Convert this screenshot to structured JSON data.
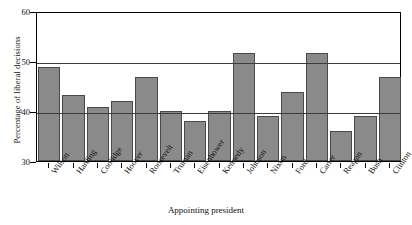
{
  "chart_data": {
    "type": "bar",
    "title": "",
    "xlabel": "Appointing president",
    "ylabel": "Percentage of liberal decisions",
    "ylim": [
      30,
      60
    ],
    "yticks": [
      30,
      40,
      50,
      60
    ],
    "ytick_labels": [
      "30",
      "40",
      "50",
      "60"
    ],
    "gridlines": [
      40,
      50
    ],
    "grid": true,
    "legend": null,
    "bar_color": "#8a8a8a",
    "bar_edge_color": "#4a4a4a",
    "categories": [
      "Wilson",
      "Harding",
      "Coolidge",
      "Hoover",
      "Roosevelt",
      "Truman",
      "Eisenhower",
      "Kennedy",
      "Johnson",
      "Nixon",
      "Ford",
      "Carter",
      "Reagan",
      "Bush",
      "Clinton"
    ],
    "values": [
      48.8,
      43.2,
      40.8,
      42.1,
      46.8,
      40.0,
      38.1,
      40.0,
      51.6,
      39.1,
      43.8,
      51.7,
      36.0,
      39.0,
      46.8
    ]
  }
}
